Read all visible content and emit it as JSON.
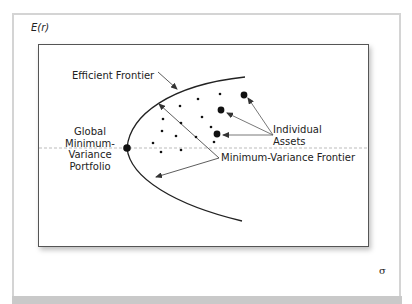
{
  "diagram": {
    "axes": {
      "y_label": "E(r)",
      "x_label": "σ"
    },
    "labels": {
      "efficient_frontier": "Efficient Frontier",
      "individual_assets_line1": "Individual",
      "individual_assets_line2": "Assets",
      "gmv_line1": "Global",
      "gmv_line2": "Minimum-",
      "gmv_line3": "Variance",
      "gmv_line4": "Portfolio",
      "min_var_frontier": "Minimum-Variance Frontier"
    },
    "colors": {
      "ink": "#222222",
      "frame": "#d4d4d4",
      "strip": "#c9c9c9",
      "dashed": "#aaaaaa"
    },
    "points": {
      "gmv": {
        "x": 127,
        "y": 148
      },
      "large_assets": [
        {
          "x": 244,
          "y": 95
        },
        {
          "x": 221,
          "y": 110
        },
        {
          "x": 217,
          "y": 134
        }
      ],
      "small_assets": [
        {
          "x": 180,
          "y": 106
        },
        {
          "x": 198,
          "y": 99
        },
        {
          "x": 220,
          "y": 94
        },
        {
          "x": 163,
          "y": 119
        },
        {
          "x": 181,
          "y": 123
        },
        {
          "x": 202,
          "y": 117
        },
        {
          "x": 162,
          "y": 131
        },
        {
          "x": 211,
          "y": 127
        },
        {
          "x": 176,
          "y": 136
        },
        {
          "x": 196,
          "y": 137
        },
        {
          "x": 214,
          "y": 142
        },
        {
          "x": 153,
          "y": 143
        },
        {
          "x": 161,
          "y": 152
        },
        {
          "x": 181,
          "y": 150
        }
      ]
    }
  }
}
